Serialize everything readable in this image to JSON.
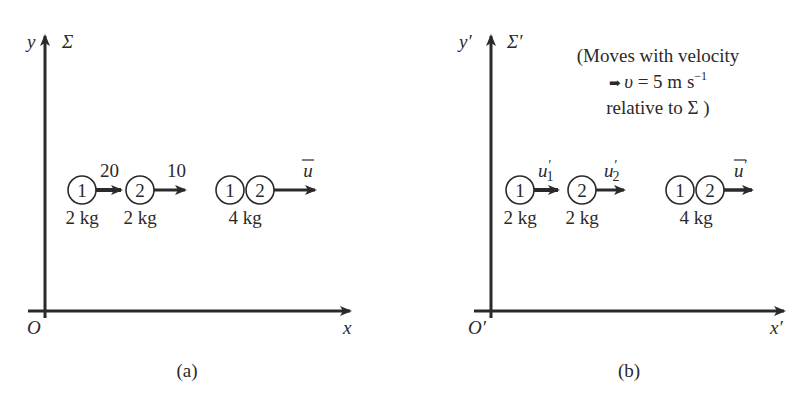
{
  "colors": {
    "ink": "#2a2a2a",
    "background": "#ffffff"
  },
  "panels": [
    {
      "id": "a",
      "caption": "(a)",
      "frame_label": "Σ",
      "axes": {
        "origin": "O",
        "x": "x",
        "y": "y"
      },
      "bodies": [
        {
          "ball": "1",
          "mass": "2 kg",
          "velocity_label": "20"
        },
        {
          "ball": "2",
          "mass": "2 kg",
          "velocity_label": "10"
        }
      ],
      "combined": {
        "balls": [
          "1",
          "2"
        ],
        "mass": "4 kg",
        "velocity_label": "u"
      }
    },
    {
      "id": "b",
      "caption": "(b)",
      "frame_label": "Σ′",
      "axes": {
        "origin": "O′",
        "x": "x′",
        "y": "y′"
      },
      "note": {
        "line1": "(Moves with velocity",
        "line2_prefix": "➡ ",
        "line2_symbol": "υ",
        "line2_text": " = 5 m s",
        "line2_sup": "−1",
        "line3": "relative to Σ )"
      },
      "bodies": [
        {
          "ball": "1",
          "mass": "2 kg",
          "velocity_label": "u",
          "velocity_prime": "′",
          "velocity_sub": "1"
        },
        {
          "ball": "2",
          "mass": "2 kg",
          "velocity_label": "u",
          "velocity_prime": "′",
          "velocity_sub": "2"
        }
      ],
      "combined": {
        "balls": [
          "1",
          "2"
        ],
        "mass": "4 kg",
        "velocity_label": "u",
        "velocity_prime": "′"
      }
    }
  ]
}
